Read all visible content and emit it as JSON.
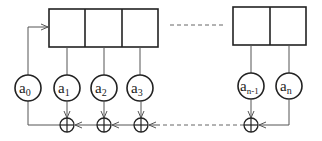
{
  "diagram": {
    "type": "linear-feedback-shift-register",
    "registers": {
      "left_cells": 3,
      "right_cells": 2,
      "gap": "dashed"
    },
    "taps": [
      {
        "base": "a",
        "sub": "0"
      },
      {
        "base": "a",
        "sub": "1"
      },
      {
        "base": "a",
        "sub": "2"
      },
      {
        "base": "a",
        "sub": "3"
      },
      {
        "base": "a",
        "sub": "n-1"
      },
      {
        "base": "a",
        "sub": "n"
      }
    ],
    "xor_symbol": "⊕",
    "colors": {
      "stroke": "#222222",
      "line": "#555555",
      "background": "#ffffff"
    }
  }
}
